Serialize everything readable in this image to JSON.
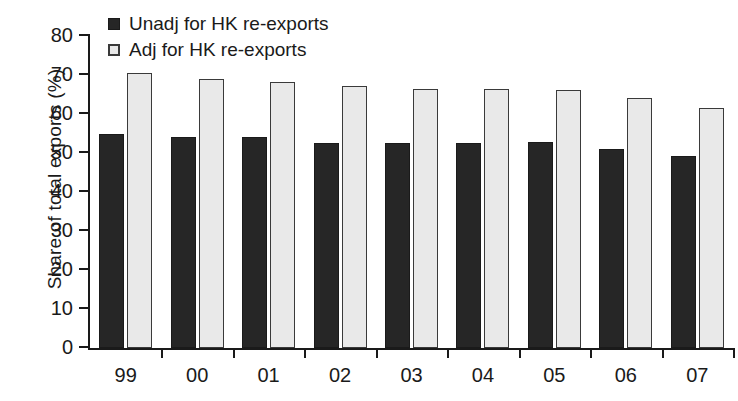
{
  "chart_data": {
    "type": "bar",
    "title": "",
    "xlabel": "",
    "ylabel": "Share of total exports (%)",
    "categories": [
      "99",
      "00",
      "01",
      "02",
      "03",
      "04",
      "05",
      "06",
      "07"
    ],
    "series": [
      {
        "name": "Unadj for HK re-exports",
        "color": "#262626",
        "values": [
          55.0,
          54.2,
          54.0,
          52.5,
          52.5,
          52.5,
          52.8,
          51.0,
          49.2
        ]
      },
      {
        "name": "Adj for HK re-exports",
        "color": "#e9e9e9",
        "values": [
          70.5,
          69.0,
          68.2,
          67.2,
          66.5,
          66.5,
          66.2,
          64.0,
          61.6
        ]
      }
    ],
    "ylim": [
      0,
      80
    ],
    "ytick_values": [
      0,
      10,
      20,
      30,
      40,
      50,
      60,
      70,
      80
    ],
    "ytick_labels": [
      "0",
      "10",
      "20",
      "30",
      "40",
      "50",
      "60",
      "70",
      "80"
    ],
    "grid": false,
    "legend_position": "top-left"
  },
  "legend": {
    "entries": [
      {
        "label": "Unadj for HK re-exports",
        "marker": "filled-square"
      },
      {
        "label": "Adj for HK re-exports",
        "marker": "open-square"
      }
    ]
  }
}
